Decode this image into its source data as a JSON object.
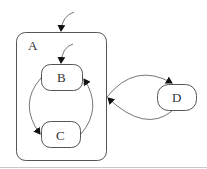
{
  "diagram": {
    "type": "statechart",
    "colors": {
      "stroke": "#555555",
      "arrow": "#111111",
      "text": "#333333",
      "background": "#ffffff"
    },
    "states": {
      "A": {
        "label": "A",
        "kind": "composite"
      },
      "B": {
        "label": "B",
        "kind": "simple",
        "parent": "A",
        "initial": true
      },
      "C": {
        "label": "C",
        "kind": "simple",
        "parent": "A"
      },
      "D": {
        "label": "D",
        "kind": "simple"
      }
    },
    "transitions": [
      {
        "from": "initial",
        "to": "A"
      },
      {
        "from": "initial",
        "to": "B"
      },
      {
        "from": "B",
        "to": "C"
      },
      {
        "from": "C",
        "to": "B"
      },
      {
        "from": "A",
        "to": "D"
      },
      {
        "from": "D",
        "to": "A"
      }
    ]
  }
}
